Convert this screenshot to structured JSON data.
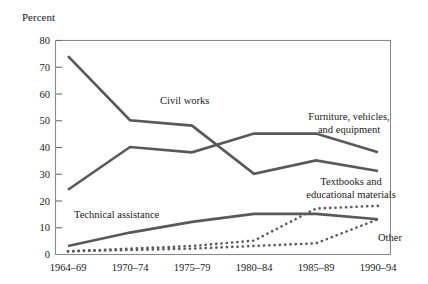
{
  "chart_data": {
    "type": "line",
    "title": "",
    "ylabel": "Percent",
    "xlabel": "",
    "ylim": [
      0,
      80
    ],
    "yticks": [
      0,
      10,
      20,
      30,
      40,
      50,
      60,
      70,
      80
    ],
    "ytick_labels": [
      "0",
      "10",
      "20",
      "30",
      "40",
      "50",
      "60",
      "70",
      "80"
    ],
    "categories": [
      "1964–69",
      "1970–74",
      "1975–79",
      "1980–84",
      "1985–89",
      "1990–94"
    ],
    "grid": false,
    "legend_position": "inline-annotations",
    "series": [
      {
        "name": "Civil works",
        "style": "solid",
        "color": "#595959",
        "values": [
          74,
          50,
          48,
          30,
          35,
          31
        ],
        "label": "Civil works",
        "label_x": 160,
        "label_y": 104
      },
      {
        "name": "Furniture, vehicles, and equipment",
        "style": "solid",
        "color": "#595959",
        "values": [
          24,
          40,
          38,
          45,
          45,
          38
        ],
        "label": "Furniture, vehicles,\nand equipment",
        "label_line1": "Furniture, vehicles,",
        "label_line2": "and equipment",
        "label_x": 349,
        "label_y": 120
      },
      {
        "name": "Technical assistance",
        "style": "solid",
        "color": "#595959",
        "values": [
          3,
          8,
          12,
          15,
          15,
          13
        ],
        "label": "Technical assistance",
        "label_x": 74,
        "label_y": 218
      },
      {
        "name": "Textbooks and educational materials",
        "style": "dotted",
        "color": "#595959",
        "values": [
          1,
          2,
          3,
          5,
          17,
          18
        ],
        "label": "Textbooks and\neducational materials",
        "label_line1": "Textbooks and",
        "label_line2": "educational materials",
        "label_x": 351,
        "label_y": 185
      },
      {
        "name": "Other",
        "style": "dotted",
        "color": "#595959",
        "values": [
          1,
          1.5,
          2,
          3,
          4,
          13
        ],
        "label": "Other",
        "label_x": 378,
        "label_y": 241
      }
    ],
    "axis_color": "#8a8a8a",
    "text_color": "#1a1a1a",
    "background": "#ffffff"
  }
}
